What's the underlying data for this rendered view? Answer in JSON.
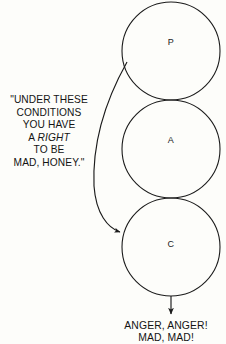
{
  "diagram": {
    "type": "transactional-analysis-ego-state-diagram",
    "background_color": "#fdfdfa",
    "stroke_color": "#1b1b1b",
    "ego_states": [
      {
        "id": "parent",
        "label": "P",
        "cx": 171,
        "cy": 51,
        "r": 49
      },
      {
        "id": "adult",
        "label": "A",
        "cx": 171,
        "cy": 149,
        "r": 49
      },
      {
        "id": "child",
        "label": "C",
        "cx": 171,
        "cy": 247,
        "r": 49
      }
    ],
    "transaction_arrow": {
      "id": "parent-to-child-arrow",
      "from": "parent",
      "to": "child",
      "shape": "curved-left-bow"
    },
    "output_arrow": {
      "id": "child-to-outcome-arrow",
      "from": "child",
      "to": "outcome",
      "shape": "straight-down"
    }
  },
  "quote": {
    "lines": [
      "\"UNDER THESE",
      "CONDITIONS",
      "YOU HAVE",
      "A ",
      "TO BE",
      "MAD, HONEY.\""
    ],
    "emphasis_word": "RIGHT",
    "line4_prefix": "A ",
    "line4_suffix": ""
  },
  "outcome": {
    "lines": [
      "ANGER, ANGER!",
      "MAD, MAD!"
    ]
  }
}
